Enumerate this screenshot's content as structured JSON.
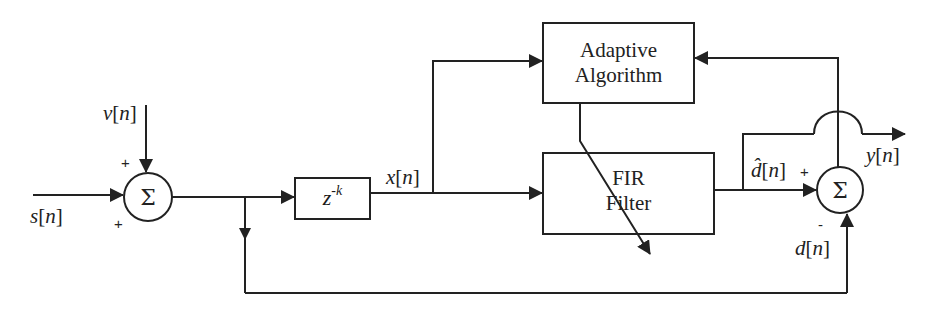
{
  "diagram": {
    "type": "adaptive-filter-block-diagram",
    "signals": {
      "input": "s[n]",
      "noise": "v[n]",
      "filter_input": "x[n]",
      "estimate": "d̂[n]",
      "desired": "d[n]",
      "output": "y[n]"
    },
    "blocks": {
      "delay": {
        "base": "z",
        "exponent": "-k"
      },
      "adaptive": {
        "line1": "Adaptive",
        "line2": "Algorithm"
      },
      "fir": {
        "line1": "FIR",
        "line2": "Filter"
      }
    },
    "summers": {
      "left": {
        "symbol": "Σ",
        "sign_top": "+",
        "sign_left": "+"
      },
      "right": {
        "symbol": "Σ",
        "sign_left": "+",
        "sign_bottom": "-"
      }
    },
    "labels": {
      "s_name": "s",
      "v_name": "v",
      "x_name": "x",
      "y_name": "y",
      "d_name": "d",
      "dhat_name": "d̂",
      "idx": "n",
      "lb": "[",
      "rb": "]"
    },
    "stroke_color": "#222222"
  }
}
